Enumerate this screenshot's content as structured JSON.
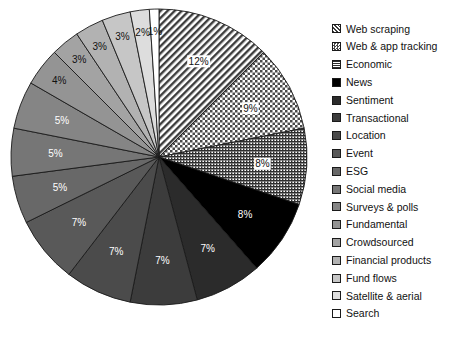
{
  "chart_data": {
    "type": "pie",
    "title": "",
    "subtitle": "",
    "xlabel": "",
    "ylabel": "",
    "legend_position": "right",
    "grid": false,
    "start_angle_deg": 0,
    "direction": "clockwise",
    "categories": [
      "Web scraping",
      "Web & app tracking",
      "Economic",
      "News",
      "Sentiment",
      "Transactional",
      "Location",
      "Event",
      "ESG",
      "Social media",
      "Surveys & polls",
      "Fundamental",
      "Crowdsourced",
      "Financial products",
      "Fund flows",
      "Satellite & aerial",
      "Search"
    ],
    "values": [
      12,
      9,
      8,
      8,
      7,
      7,
      7,
      7,
      5,
      5,
      5,
      4,
      3,
      3,
      3,
      2,
      1
    ],
    "labels": [
      "12%",
      "9%",
      "8%",
      "8%",
      "7%",
      "7%",
      "7%",
      "7%",
      "5%",
      "5%",
      "5%",
      "4%",
      "3%",
      "3%",
      "3%",
      "2%",
      "1%"
    ],
    "slices": [
      {
        "name": "Web scraping",
        "value": 12,
        "label": "12%",
        "fill": "hatch-diagonal",
        "color": "#9a9a9a"
      },
      {
        "name": "Web & app tracking",
        "value": 9,
        "label": "9%",
        "fill": "checker",
        "color": "#b4b4b4"
      },
      {
        "name": "Economic",
        "value": 8,
        "label": "8%",
        "fill": "hatch-fine",
        "color": "#8f8f8f"
      },
      {
        "name": "News",
        "value": 8,
        "label": "8%",
        "fill": "solid",
        "color": "#000000"
      },
      {
        "name": "Sentiment",
        "value": 7,
        "label": "7%",
        "fill": "solid",
        "color": "#2b2b2b"
      },
      {
        "name": "Transactional",
        "value": 7,
        "label": "7%",
        "fill": "solid",
        "color": "#3c3c3c"
      },
      {
        "name": "Location",
        "value": 7,
        "label": "7%",
        "fill": "solid",
        "color": "#4b4b4b"
      },
      {
        "name": "Event",
        "value": 7,
        "label": "7%",
        "fill": "solid",
        "color": "#595959"
      },
      {
        "name": "ESG",
        "value": 5,
        "label": "5%",
        "fill": "solid",
        "color": "#686868"
      },
      {
        "name": "Social media",
        "value": 5,
        "label": "5%",
        "fill": "solid",
        "color": "#767676"
      },
      {
        "name": "Surveys & polls",
        "value": 5,
        "label": "5%",
        "fill": "solid",
        "color": "#858585"
      },
      {
        "name": "Fundamental",
        "value": 4,
        "label": "4%",
        "fill": "solid",
        "color": "#949494"
      },
      {
        "name": "Crowdsourced",
        "value": 3,
        "label": "3%",
        "fill": "solid",
        "color": "#a3a3a3"
      },
      {
        "name": "Financial products",
        "value": 3,
        "label": "3%",
        "fill": "solid",
        "color": "#b2b2b2"
      },
      {
        "name": "Fund flows",
        "value": 3,
        "label": "3%",
        "fill": "solid",
        "color": "#c6c6c6"
      },
      {
        "name": "Satellite & aerial",
        "value": 2,
        "label": "2%",
        "fill": "solid",
        "color": "#dddddd"
      },
      {
        "name": "Search",
        "value": 1,
        "label": "1%",
        "fill": "solid",
        "color": "#ffffff"
      }
    ]
  },
  "legend": {
    "items": [
      {
        "label": "Web scraping"
      },
      {
        "label": "Web & app tracking"
      },
      {
        "label": "Economic"
      },
      {
        "label": "News"
      },
      {
        "label": "Sentiment"
      },
      {
        "label": "Transactional"
      },
      {
        "label": "Location"
      },
      {
        "label": "Event"
      },
      {
        "label": "ESG"
      },
      {
        "label": "Social media"
      },
      {
        "label": "Surveys & polls"
      },
      {
        "label": "Fundamental"
      },
      {
        "label": "Crowdsourced"
      },
      {
        "label": "Financial products"
      },
      {
        "label": "Fund flows"
      },
      {
        "label": "Satellite & aerial"
      },
      {
        "label": "Search"
      }
    ]
  },
  "style": {
    "edge_color": "#1a1a1a",
    "label_text_color_dark": "#111111",
    "label_text_color_light": "#ffffff",
    "background": "#ffffff"
  }
}
